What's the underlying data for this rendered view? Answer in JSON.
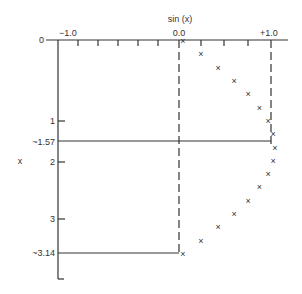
{
  "chart_data": {
    "type": "scatter",
    "title": "",
    "xlabel": "sin (x)",
    "ylabel": "x",
    "orientation": "x plotted downward on vertical axis, sin(x) horizontal",
    "x_axis": {
      "min": -1.0,
      "max": 1.0,
      "tick_labels": [
        "−1.0",
        "0.0",
        "+1.0"
      ]
    },
    "y_axis": {
      "min": 0,
      "max": 3.14,
      "tick_labels": [
        "0",
        "1",
        "~1.57",
        "2",
        "3",
        "~3.14"
      ]
    },
    "grid": false,
    "legend": null,
    "marker": "x",
    "series": [
      {
        "name": "sin(x)",
        "x": [
          0,
          0.196,
          0.393,
          0.589,
          0.785,
          0.982,
          1.178,
          1.374,
          1.571,
          1.767,
          1.963,
          2.16,
          2.356,
          2.553,
          2.749,
          2.945,
          3.142
        ],
        "values": [
          0.0,
          0.195,
          0.383,
          0.556,
          0.707,
          0.831,
          0.924,
          0.981,
          1.0,
          0.981,
          0.924,
          0.831,
          0.707,
          0.556,
          0.383,
          0.195,
          0.0
        ]
      }
    ],
    "reference_lines": [
      {
        "type": "vertical-dashed",
        "at": 0.0
      },
      {
        "type": "vertical-dashed",
        "at": 1.0
      },
      {
        "type": "horizontal",
        "at": 1.57
      },
      {
        "type": "horizontal",
        "at": 3.14
      }
    ]
  },
  "labels": {
    "xtitle": "sin (x)",
    "ytitle": "x",
    "xt_neg": "−1.0",
    "xt_zero": "0.0",
    "xt_pos": "+1.0",
    "y0": "0",
    "y1": "1",
    "y157": "~1.57",
    "y2": "2",
    "y3": "3",
    "y314": "~3.14"
  }
}
